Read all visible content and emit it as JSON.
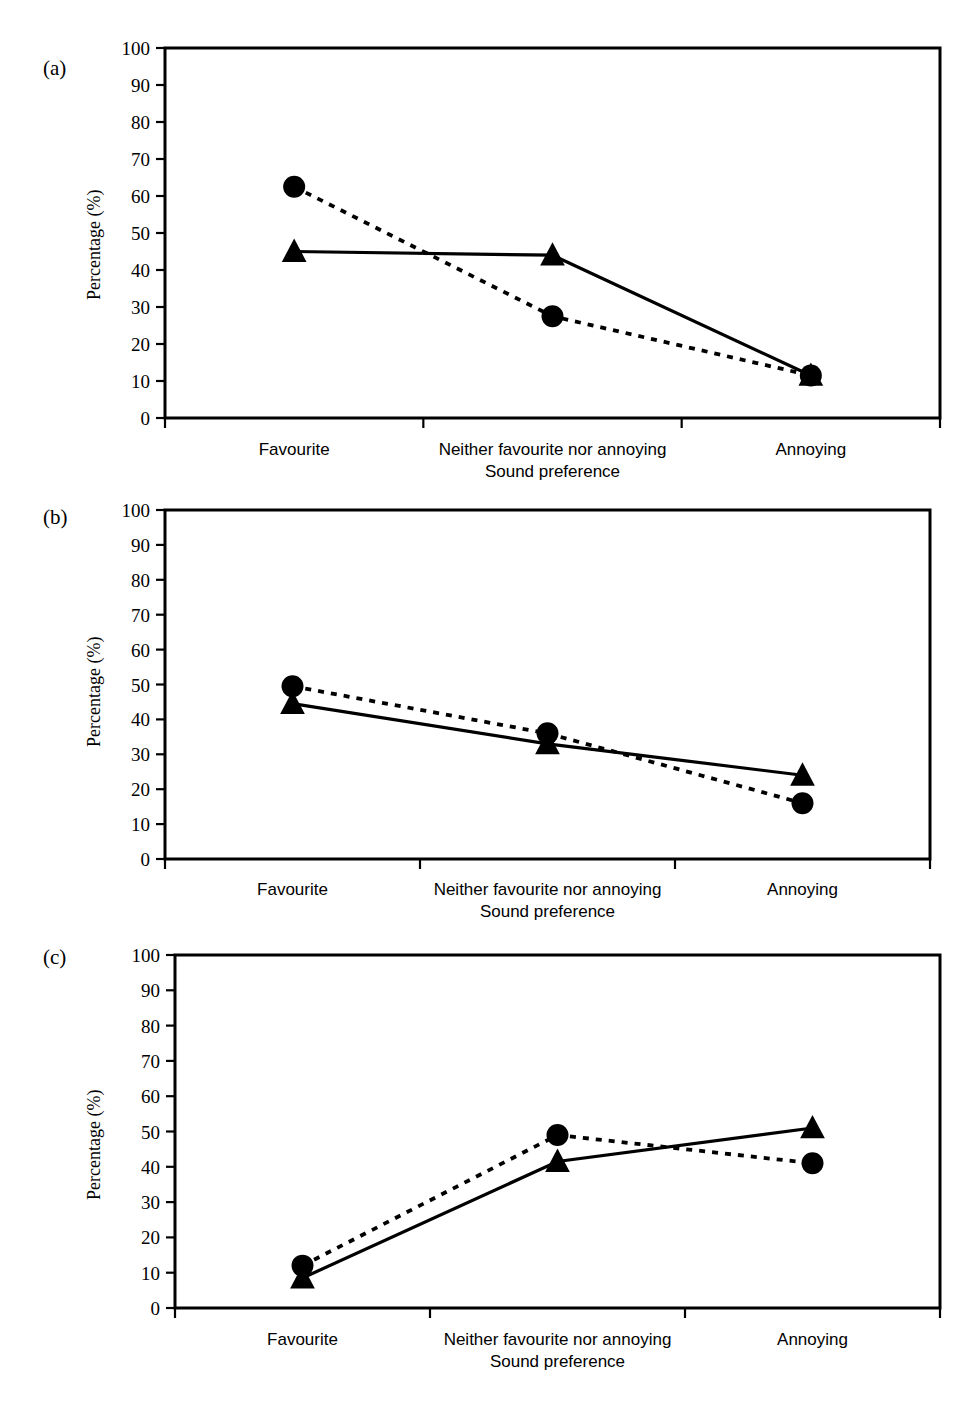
{
  "figure": {
    "panels": [
      {
        "id": "a",
        "label": "(a)"
      },
      {
        "id": "b",
        "label": "(b)"
      },
      {
        "id": "c",
        "label": "(c)"
      }
    ]
  },
  "chart_data": [
    {
      "type": "line",
      "panel": "(a)",
      "title": "",
      "xlabel": "Sound preference",
      "ylabel": "Percentage (%)",
      "categories": [
        "Favourite",
        "Neither favourite nor annoying",
        "Annoying"
      ],
      "ylim": [
        0,
        100
      ],
      "yticks": [
        0,
        10,
        20,
        30,
        40,
        50,
        60,
        70,
        80,
        90,
        100
      ],
      "grid": false,
      "legend": "none",
      "series": [
        {
          "name": "circle-dotted",
          "marker": "circle",
          "linestyle": "dotted",
          "values": [
            62.5,
            27.5,
            11.5
          ]
        },
        {
          "name": "triangle-solid",
          "marker": "triangle",
          "linestyle": "solid",
          "values": [
            45,
            44,
            11.5
          ]
        }
      ]
    },
    {
      "type": "line",
      "panel": "(b)",
      "title": "",
      "xlabel": "Sound preference",
      "ylabel": "Percentage (%)",
      "categories": [
        "Favourite",
        "Neither favourite nor annoying",
        "Annoying"
      ],
      "ylim": [
        0,
        100
      ],
      "yticks": [
        0,
        10,
        20,
        30,
        40,
        50,
        60,
        70,
        80,
        90,
        100
      ],
      "grid": false,
      "legend": "none",
      "series": [
        {
          "name": "circle-dotted",
          "marker": "circle",
          "linestyle": "dotted",
          "values": [
            49.5,
            36,
            16
          ]
        },
        {
          "name": "triangle-solid",
          "marker": "triangle",
          "linestyle": "solid",
          "values": [
            44.5,
            33,
            24
          ]
        }
      ]
    },
    {
      "type": "line",
      "panel": "(c)",
      "title": "",
      "xlabel": "Sound preference",
      "ylabel": "Percentage (%)",
      "categories": [
        "Favourite",
        "Neither favourite nor annoying",
        "Annoying"
      ],
      "ylim": [
        0,
        100
      ],
      "yticks": [
        0,
        10,
        20,
        30,
        40,
        50,
        60,
        70,
        80,
        90,
        100
      ],
      "grid": false,
      "legend": "none",
      "series": [
        {
          "name": "circle-dotted",
          "marker": "circle",
          "linestyle": "dotted",
          "values": [
            12,
            49,
            41
          ]
        },
        {
          "name": "triangle-solid",
          "marker": "triangle",
          "linestyle": "solid",
          "values": [
            8.5,
            41.5,
            51
          ]
        }
      ]
    }
  ],
  "colors": {
    "ink": "#000000",
    "background": "#ffffff"
  }
}
